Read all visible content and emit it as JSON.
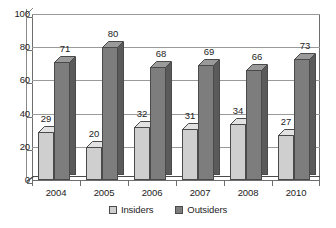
{
  "chart_data": {
    "type": "bar",
    "title": "",
    "subtitle": "",
    "xlabel": "",
    "ylabel": "",
    "categories": [
      "2004",
      "2005",
      "2006",
      "2007",
      "2008",
      "2010"
    ],
    "series": [
      {
        "name": "Insiders",
        "values": [
          29,
          20,
          32,
          31,
          34,
          27
        ],
        "color": "#cfcfcf"
      },
      {
        "name": "Outsiders",
        "values": [
          71,
          80,
          68,
          69,
          66,
          73
        ],
        "color": "#7d7d7d"
      }
    ],
    "ylim": [
      0,
      100
    ],
    "yticks": [
      0,
      20,
      40,
      60,
      80,
      100
    ],
    "ytick_labels": [
      "0",
      "20",
      "40",
      "60",
      "80",
      "100"
    ],
    "grid": true,
    "grid_axis": "y",
    "legend_position": "bottom",
    "data_labels": true,
    "style": "3d-column"
  },
  "legend": {
    "items": [
      {
        "label": "Insiders",
        "swatch": "legend-swatch-insiders"
      },
      {
        "label": "Outsiders",
        "swatch": "legend-swatch-outsiders"
      }
    ]
  },
  "colors": {
    "insiders_front": "#cfcfcf",
    "insiders_side": "#a8a8a8",
    "insiders_top": "#e2e2e2",
    "outsiders_front": "#7d7d7d",
    "outsiders_side": "#5a5a5a",
    "outsiders_top": "#9a9a9a",
    "axis": "#6d6d6d",
    "gridline": "#9a9a9a",
    "text": "#1d1d1d",
    "background": "#ffffff"
  }
}
